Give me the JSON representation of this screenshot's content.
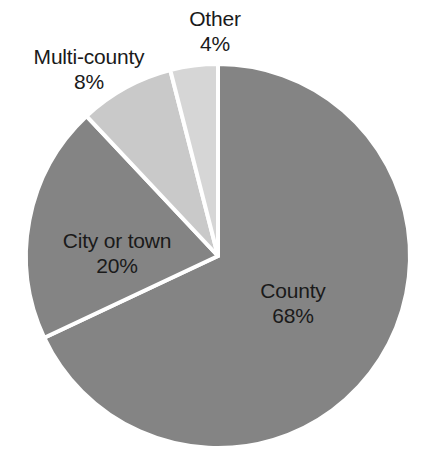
{
  "chart_data": {
    "type": "pie",
    "title": "",
    "subtitle": "",
    "xlabel": "",
    "ylabel": "",
    "legend_position": "none",
    "grid": false,
    "value_unit": "percent",
    "start_angle_deg": 0,
    "direction": "clockwise",
    "categories": [
      "County",
      "City or town",
      "Multi-county",
      "Other"
    ],
    "values": [
      68,
      20,
      8,
      4
    ],
    "colors": [
      "#848484",
      "#848484",
      "#c9c9c9",
      "#d6d6d6"
    ],
    "slice_separator_color": "#ffffff",
    "background_color": "#ffffff",
    "slices": [
      {
        "label": "County",
        "value": 68,
        "value_text": "68%",
        "color": "#848484",
        "label_name": "County",
        "label_value": "68%"
      },
      {
        "label": "City or town",
        "value": 20,
        "value_text": "20%",
        "color": "#848484",
        "label_name": "City or town",
        "label_value": "20%"
      },
      {
        "label": "Multi-county",
        "value": 8,
        "value_text": "8%",
        "color": "#c9c9c9",
        "label_name": "Multi-county",
        "label_value": "8%"
      },
      {
        "label": "Other",
        "value": 4,
        "value_text": "4%",
        "color": "#d6d6d6",
        "label_name": "Other",
        "label_value": "4%"
      }
    ]
  },
  "labels": {
    "county": {
      "name": "County",
      "value": "68%"
    },
    "city_or_town": {
      "name": "City or town",
      "value": "20%"
    },
    "multi_county": {
      "name": "Multi-county",
      "value": "8%"
    },
    "other": {
      "name": "Other",
      "value": "4%"
    }
  }
}
